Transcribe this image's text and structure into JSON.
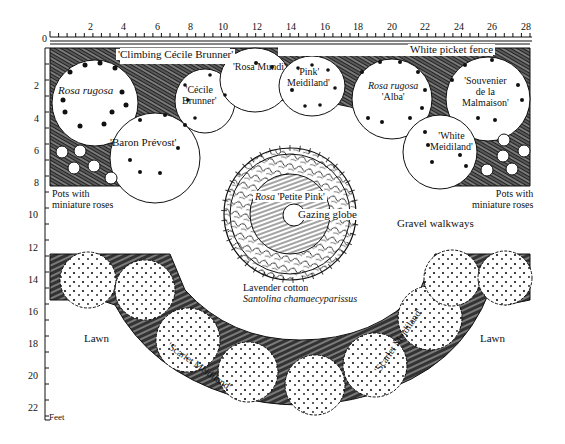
{
  "diagram": {
    "type": "garden-plan",
    "units_label": "Feet",
    "x_axis": {
      "ticks": [
        "0",
        "2",
        "4",
        "6",
        "8",
        "10",
        "12",
        "14",
        "16",
        "18",
        "20",
        "22",
        "24",
        "26",
        "28"
      ]
    },
    "y_axis": {
      "ticks": [
        "2",
        "4",
        "6",
        "8",
        "10",
        "12",
        "14",
        "16",
        "18",
        "20",
        "22"
      ]
    },
    "colors": {
      "ink": "#111111",
      "paper": "#ffffff"
    }
  },
  "labels": {
    "fence": "White picket fence",
    "climbing_cecile": "'Climbing Cécile Brunner'",
    "rosa_rugosa_left": "Rosa rugosa",
    "baron_prevost": "'Baron Prévost'",
    "cecile_line1": "'Cécile",
    "cecile_line2": "Brunner'",
    "rosa_mundi": "'Rosa Mundi'",
    "pink_line1": "'Pink'",
    "pink_line2": "Meidiland'",
    "rugosa_alba_line1": "Rosa rugosa",
    "rugosa_alba_line2": "'Alba'",
    "souvenir_line1": "'Souvenier",
    "souvenir_line2": "de la",
    "souvenir_line3": "Malmaison'",
    "white_line1": "'White",
    "white_line2": "Meidiland'",
    "pots_left_line1": "Pots with",
    "pots_left_line2": "miniature roses",
    "pots_right_line1": "Pots with",
    "pots_right_line2": "miniature roses",
    "petite_italic": "Rosa",
    "petite_rest": " 'Petite Pink'",
    "gazing_globe": "Gazing globe",
    "gravel": "Gravel walkways",
    "lavender_line1": "Lavender cotton",
    "lavender_line2": "Santolina chamaecyparissus",
    "scarlet_left": "'Scarlet Meidiland'",
    "scarlet_right": "'Scarlet Meidiland'",
    "lawn_left": "Lawn",
    "lawn_right": "Lawn"
  }
}
